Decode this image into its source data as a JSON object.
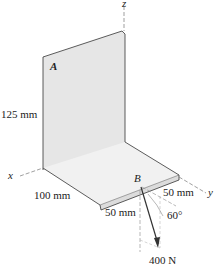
{
  "diagram": {
    "axes": {
      "x": "x",
      "y": "y",
      "z": "z"
    },
    "plate_label": "A",
    "point_label": "B",
    "dimensions": {
      "height": "125 mm",
      "depth": "100 mm",
      "offset_b_x": "50 mm",
      "offset_b_y": "50 mm"
    },
    "angle": "60°",
    "force": "400 N",
    "colors": {
      "plate_fill": "#e6e6e6",
      "line": "#333333",
      "dashed": "#777777"
    }
  }
}
